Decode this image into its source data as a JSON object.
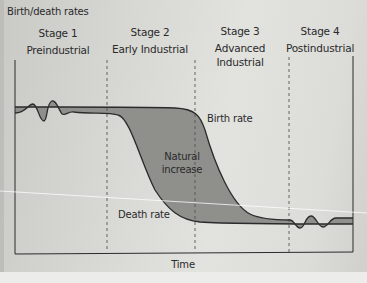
{
  "figure": {
    "y_axis_label": "Birth/death rates",
    "x_axis_label": "Time",
    "stages": [
      {
        "number": "Stage 1",
        "name": "Preindustrial"
      },
      {
        "number": "Stage 2",
        "name": "Early Industrial"
      },
      {
        "number": "Stage 3",
        "name": "Advanced",
        "name_line2": "Industrial"
      },
      {
        "number": "Stage 4",
        "name": "Postindustrial"
      }
    ],
    "curve_labels": {
      "birth_rate": "Birth rate",
      "death_rate": "Death rate",
      "natural_increase_line1": "Natural",
      "natural_increase_line2": "increase"
    },
    "colors": {
      "fill": "#8f8f8c",
      "line": "#2b2b2b",
      "divider": "#555555"
    }
  }
}
